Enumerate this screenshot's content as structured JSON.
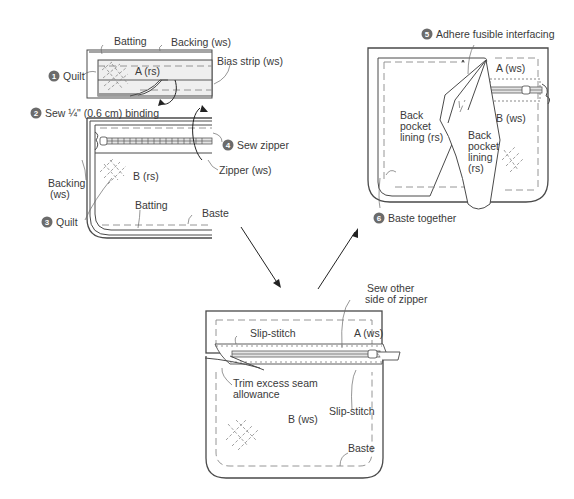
{
  "diagram": {
    "type": "sewing-instruction-diagram",
    "panels": [
      {
        "id": "panel-1",
        "position": "top-left",
        "labels": {
          "batting_top": "Batting",
          "backing_top": "Backing (ws)",
          "bias_strip": "Bias strip (ws)",
          "a_rs": "A (rs)",
          "b_rs": "B (rs)",
          "backing_side": "Backing",
          "backing_side_ws": "(ws)",
          "batting_bottom": "Batting",
          "baste": "Baste",
          "zipper_ws": "Zipper (ws)"
        },
        "steps": [
          {
            "number": "1",
            "text": "Quilt"
          },
          {
            "number": "2",
            "text": "Sew ¼\" (0.6 cm) binding"
          },
          {
            "number": "3",
            "text": "Quilt"
          },
          {
            "number": "4",
            "text": "Sew zipper"
          }
        ]
      },
      {
        "id": "panel-2",
        "position": "top-right",
        "labels": {
          "a_ws": "A (ws)",
          "b_ws": "B (ws)",
          "back_pocket_lining_1": "Back",
          "back_pocket_lining_2": "pocket",
          "back_pocket_lining_3": "lining (rs)",
          "flap_1": "Back",
          "flap_2": "pocket",
          "flap_3": "lining",
          "flap_4": "(rs)"
        },
        "steps": [
          {
            "number": "5",
            "text": "Adhere fusible interfacing"
          },
          {
            "number": "6",
            "text": "Baste together"
          }
        ]
      },
      {
        "id": "panel-3",
        "position": "bottom-center",
        "labels": {
          "sew_other_1": "Sew other",
          "sew_other_2": "side of zipper",
          "slip_stitch_top": "Slip-stitch",
          "a_ws": "A (ws)",
          "trim_1": "Trim excess seam",
          "trim_2": "allowance",
          "b_ws": "B (ws)",
          "slip_stitch_right": "Slip-stitch",
          "baste": "Baste"
        }
      }
    ],
    "colors": {
      "line": "#4a4a4a",
      "step_circle": "#6b6b6b",
      "text": "#3a3a3a"
    }
  }
}
